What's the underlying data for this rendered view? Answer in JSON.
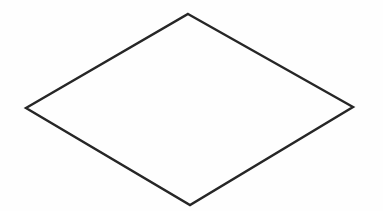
{
  "diagram": {
    "type": "shape",
    "background": "#fefefe",
    "shapes": [
      {
        "kind": "diamond",
        "label": "",
        "stroke": "#262626",
        "stroke_width": 2.4,
        "fill": "none",
        "points": {
          "top": [
            188,
            14
          ],
          "right": [
            353,
            107
          ],
          "bottom": [
            190,
            205
          ],
          "left": [
            26,
            108
          ]
        }
      }
    ]
  }
}
